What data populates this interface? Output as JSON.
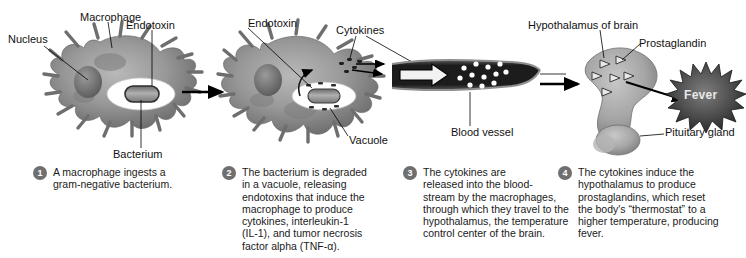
{
  "figure": {
    "background_color": "#ffffff",
    "cell_color": "#8a8a8a",
    "badge_color": "#6f6f6f",
    "vessel_color": "#2b2b2b",
    "fever_color": "#4a4a4a"
  },
  "labels": {
    "nucleus": "Nucleus",
    "macrophage": "Macrophage",
    "endotoxin_1": "Endotoxin",
    "bacterium": "Bacterium",
    "endotoxin_2": "Endotoxin",
    "cytokines": "Cytokines",
    "vacuole": "Vacuole",
    "blood_vessel": "Blood\nvessel",
    "hypothalamus": "Hypothalamus of brain",
    "prostaglandin": "Prostaglandin",
    "pituitary": "Pituitary\ngland",
    "fever": "Fever"
  },
  "steps": [
    {
      "number": "1",
      "text": "A macrophage ingests a\ngram-negative bacterium."
    },
    {
      "number": "2",
      "text": "The bacterium is degraded\nin a vacuole, releasing\nendotoxins that induce the\nmacrophage to produce\ncytokines, interleukin-1\n(IL-1), and tumor necrosis\nfactor alpha (TNF-α)."
    },
    {
      "number": "3",
      "text": "The cytokines are\nreleased into the blood-\nstream by the macrophages,\nthrough which they travel to the\nhypothalamus, the temperature\ncontrol center of the brain."
    },
    {
      "number": "4",
      "text": "The cytokines induce the\nhypothalamus to produce\nprostaglandins, which reset\nthe body's “thermostat” to a\nhigher temperature, producing\nfever."
    }
  ]
}
